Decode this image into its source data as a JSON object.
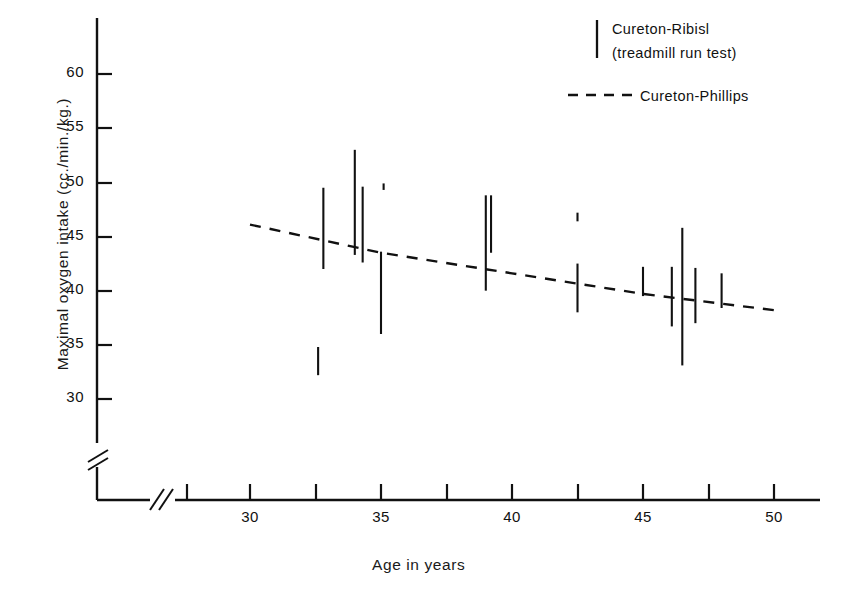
{
  "chart_data": {
    "type": "scatter",
    "title": "",
    "xlabel": "Age in years",
    "ylabel": "Maximal oxygen intake (cc./min./kg.)",
    "xlim": [
      26,
      52
    ],
    "ylim": [
      28,
      63
    ],
    "grid": false,
    "axis_break_x": true,
    "axis_break_y": true,
    "legend_position": "top-right",
    "x_ticks": [
      27.5,
      30,
      32.5,
      35,
      37.5,
      40,
      42.5,
      45,
      47.5,
      50
    ],
    "x_tick_labels": [
      "",
      "30",
      "",
      "35",
      "",
      "40",
      "",
      "45",
      "",
      "50"
    ],
    "y_ticks": [
      30,
      35,
      40,
      45,
      50,
      55,
      60
    ],
    "y_tick_labels": [
      "30",
      "35",
      "40",
      "45",
      "50",
      "55",
      "60"
    ],
    "series": [
      {
        "name": "Cureton-Ribisl (treadmill run test)",
        "marker": "vertical-range-bar",
        "ranges": [
          {
            "age": 32.8,
            "low": 42.0,
            "high": 49.5
          },
          {
            "age": 32.6,
            "low": 32.2,
            "high": 34.8
          },
          {
            "age": 34.0,
            "low": 43.3,
            "high": 53.0
          },
          {
            "age": 34.3,
            "low": 42.6,
            "high": 49.6
          },
          {
            "age": 35.1,
            "low": 49.3,
            "high": 49.9
          },
          {
            "age": 35.0,
            "low": 36.0,
            "high": 43.6
          },
          {
            "age": 39.0,
            "low": 40.0,
            "high": 48.8
          },
          {
            "age": 39.2,
            "low": 43.5,
            "high": 48.8
          },
          {
            "age": 42.5,
            "low": 46.4,
            "high": 47.2
          },
          {
            "age": 42.5,
            "low": 38.0,
            "high": 42.5
          },
          {
            "age": 45.0,
            "low": 39.5,
            "high": 42.2
          },
          {
            "age": 46.1,
            "low": 36.7,
            "high": 42.2
          },
          {
            "age": 46.5,
            "low": 33.1,
            "high": 45.8
          },
          {
            "age": 47.0,
            "low": 37.0,
            "high": 42.1
          },
          {
            "age": 48.0,
            "low": 38.4,
            "high": 41.6
          }
        ]
      },
      {
        "name": "Cureton-Phillips",
        "marker": "dashed-line",
        "points": [
          {
            "age": 30.0,
            "value": 46.1
          },
          {
            "age": 35.0,
            "value": 43.5
          },
          {
            "age": 40.0,
            "value": 41.6
          },
          {
            "age": 45.0,
            "value": 39.7
          },
          {
            "age": 50.0,
            "value": 38.2
          }
        ]
      }
    ]
  },
  "legend": {
    "ribisl_line1": "Cureton-Ribisl",
    "ribisl_line2": "(treadmill run test)",
    "phillips_label": "Cureton-Phillips"
  },
  "axes": {
    "xlabel": "Age in years",
    "ylabel": "Maximal oxygen intake (cc./min./kg.)",
    "y_tick_labels": [
      "60",
      "55",
      "50",
      "45",
      "40",
      "35",
      "30"
    ],
    "x_tick_labels": [
      "30",
      "35",
      "40",
      "45",
      "50"
    ]
  },
  "colors": {
    "ink": "#111111",
    "background": "#ffffff"
  }
}
